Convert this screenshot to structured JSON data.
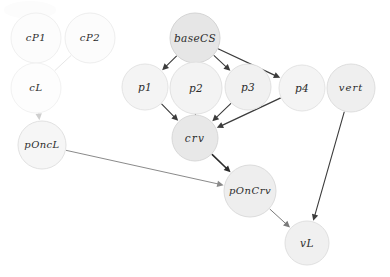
{
  "diagram": {
    "width": 390,
    "height": 277,
    "background": "#ffffff",
    "nodes": [
      {
        "id": "cP1",
        "label": "cP1",
        "cx": 36,
        "cy": 38,
        "r": 25,
        "fill": "#fcfcfc",
        "stroke": "#f0f0f0",
        "fontSize": 10,
        "letterSpacing": 0.6,
        "textFill": "#4a4a4a"
      },
      {
        "id": "cP2",
        "label": "cP2",
        "cx": 90,
        "cy": 38,
        "r": 25,
        "fill": "#fcfcfc",
        "stroke": "#eeeeee",
        "fontSize": 10,
        "letterSpacing": 0.6,
        "textFill": "#4a4a4a"
      },
      {
        "id": "cL",
        "label": "cL",
        "cx": 36,
        "cy": 88,
        "r": 25,
        "fill": "#fdfdfd",
        "stroke": "#f2f2f2",
        "fontSize": 10,
        "letterSpacing": 0.6,
        "textFill": "#4a4a4a"
      },
      {
        "id": "pOncL",
        "label": "pOncL",
        "cx": 42,
        "cy": 145,
        "r": 24,
        "fill": "#f6f6f6",
        "stroke": "#e2e2e2",
        "fontSize": 10,
        "letterSpacing": 0.4,
        "textFill": "#3a3a3a"
      },
      {
        "id": "baseCS",
        "label": "baseCS",
        "cx": 195,
        "cy": 38,
        "r": 25,
        "fill": "#e6e6e6",
        "stroke": "#d4d4d4",
        "fontSize": 10.5,
        "letterSpacing": 0.4,
        "textFill": "#2b2b2b"
      },
      {
        "id": "p1",
        "label": "p1",
        "cx": 145,
        "cy": 87,
        "r": 23,
        "fill": "#f4f4f4",
        "stroke": "#e4e4e4",
        "fontSize": 10.5,
        "letterSpacing": 0.3,
        "textFill": "#2f2f2f"
      },
      {
        "id": "p2",
        "label": "p2",
        "cx": 196,
        "cy": 88,
        "r": 26,
        "fill": "#f3f3f3",
        "stroke": "#e2e2e2",
        "fontSize": 10.5,
        "letterSpacing": 0.3,
        "textFill": "#2f2f2f"
      },
      {
        "id": "p3",
        "label": "p3",
        "cx": 248,
        "cy": 87,
        "r": 23,
        "fill": "#f1f1f1",
        "stroke": "#e0e0e0",
        "fontSize": 10.5,
        "letterSpacing": 0.3,
        "textFill": "#2f2f2f"
      },
      {
        "id": "p4",
        "label": "p4",
        "cx": 302,
        "cy": 88,
        "r": 23,
        "fill": "#f4f4f4",
        "stroke": "#e4e4e4",
        "fontSize": 10.5,
        "letterSpacing": 0.3,
        "textFill": "#2f2f2f"
      },
      {
        "id": "vert",
        "label": "vert",
        "cx": 351,
        "cy": 88,
        "r": 24,
        "fill": "#efefef",
        "stroke": "#dedede",
        "fontSize": 10,
        "letterSpacing": 1.0,
        "textFill": "#3a3a3a"
      },
      {
        "id": "crv",
        "label": "crv",
        "cx": 195,
        "cy": 138,
        "r": 23,
        "fill": "#e8e8e8",
        "stroke": "#d8d8d8",
        "fontSize": 10.5,
        "letterSpacing": 1.2,
        "textFill": "#2b2b2b"
      },
      {
        "id": "pOnCrv",
        "label": "pOnCrv",
        "cx": 250,
        "cy": 191,
        "r": 26,
        "fill": "#eeeeee",
        "stroke": "#dcdcdc",
        "fontSize": 10,
        "letterSpacing": 0.5,
        "textFill": "#2b2b2b"
      },
      {
        "id": "vL",
        "label": "vL",
        "cx": 307,
        "cy": 243,
        "r": 22,
        "fill": "#f0f0f0",
        "stroke": "#e0e0e0",
        "fontSize": 10.5,
        "letterSpacing": 0.5,
        "textFill": "#2f2f2f"
      }
    ],
    "edges": [
      {
        "id": "cP1-cL",
        "from": "cP1",
        "to": "cL",
        "stroke": "#e9e9e9",
        "width": 1.0,
        "arrow": true
      },
      {
        "id": "cP2-cL",
        "from": "cP2",
        "to": "cL",
        "stroke": "#e6e6e6",
        "width": 1.0,
        "arrow": false
      },
      {
        "id": "cL-pOncL",
        "from": "cL",
        "to": "pOncL",
        "stroke": "#cfcfcf",
        "width": 1.0,
        "arrow": true
      },
      {
        "id": "baseCS-p1",
        "from": "baseCS",
        "to": "p1",
        "stroke": "#3c3c3c",
        "width": 1.1,
        "arrow": true
      },
      {
        "id": "baseCS-p2",
        "from": "baseCS",
        "to": "p2",
        "stroke": "#3c3c3c",
        "width": 1.1,
        "arrow": true
      },
      {
        "id": "baseCS-p3",
        "from": "baseCS",
        "to": "p3",
        "stroke": "#3c3c3c",
        "width": 1.1,
        "arrow": true
      },
      {
        "id": "baseCS-p4",
        "from": "baseCS",
        "to": "p4",
        "stroke": "#3c3c3c",
        "width": 1.3,
        "arrow": true
      },
      {
        "id": "p1-crv",
        "from": "p1",
        "to": "crv",
        "stroke": "#3c3c3c",
        "width": 1.1,
        "arrow": true
      },
      {
        "id": "p2-crv",
        "from": "p2",
        "to": "crv",
        "stroke": "#3c3c3c",
        "width": 1.1,
        "arrow": true
      },
      {
        "id": "p3-crv",
        "from": "p3",
        "to": "crv",
        "stroke": "#3c3c3c",
        "width": 1.1,
        "arrow": true
      },
      {
        "id": "p4-crv",
        "from": "p4",
        "to": "crv",
        "stroke": "#3c3c3c",
        "width": 1.3,
        "arrow": true
      },
      {
        "id": "crv-pOnCrv",
        "from": "crv",
        "to": "pOnCrv",
        "stroke": "#2b2b2b",
        "width": 1.6,
        "arrow": true
      },
      {
        "id": "pOncL-pOnCrv",
        "from": "pOncL",
        "to": "pOnCrv",
        "stroke": "#8a8a8a",
        "width": 1.0,
        "arrow": true
      },
      {
        "id": "pOnCrv-vL",
        "from": "pOnCrv",
        "to": "vL",
        "stroke": "#7a7a7a",
        "width": 1.0,
        "arrow": true
      },
      {
        "id": "vert-vL",
        "from": "vert",
        "to": "vL",
        "stroke": "#3c3c3c",
        "width": 1.1,
        "arrow": true
      }
    ],
    "artifacts": [
      {
        "id": "top-left-smudge",
        "cx": 30,
        "cy": 10,
        "rx": 26,
        "ry": 9,
        "fill": "#fcfcfc"
      }
    ]
  }
}
